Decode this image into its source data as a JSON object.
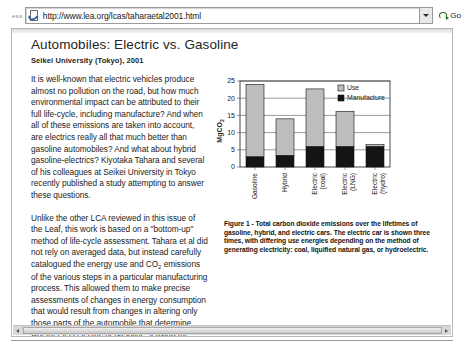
{
  "browser": {
    "addr_prefix": "ess",
    "url": "http://www.lea.org/lcas/taharaetal2001.html",
    "go_label": "Go",
    "ie_icon": "internet-explorer-page-icon",
    "dropdown_icon": "chevron-down-icon",
    "go_icon": "go-arrow-icon"
  },
  "document": {
    "title": "Automobiles: Electric vs. Gasoline",
    "subtitle": "Seikei University (Tokyo), 2001",
    "paragraph1_a": "It is well-known that electric vehicles produce almost no pollution on the road, but how much environmental impact can be attributed to their full life-cycle, including manufacture? And when all of these emissions are taken into account, are electrics really all that much better than gasoline automobiles? And what about hybrid gasoline-electrics? Kiyotaka Tahara and several of his colleagues at Seikei University in Tokyo recently published a study attempting to answer these questions.",
    "paragraph2_a": "Unlike the other LCA reviewed in this issue of the Leaf, this work is based on a \"bottom-up\" method of life-cycle assessment. Tahara et al did not rely on averaged data, but instead carefully catalogued the energy use and CO",
    "paragraph2_sub": "2",
    "paragraph2_b": " emissions of the various steps in a particular manufacturing process. This allowed them to make precise assessments of changes in energy consumption that would result from changes in altering only those parts of the automobile that determine whether it is electric or gasoline, leaving the body, interior, tires etc. unchanged. This ensures a fair comparison between the gasoline, electric and hybrid models.",
    "figure_caption": "Figure 1 - Total carbon dioxide emissions over the lifetimes of gasoline, hybrid, and electric cars. The electric car is shown three times, with differing use energies depending on the method of generating electricity: coal, liquified natural gas, or hydroelectric."
  },
  "chart_data": {
    "type": "bar",
    "stacked": true,
    "title": "",
    "xlabel": "",
    "ylabel": "MgCO2",
    "ylabel_display": "MgCO",
    "ylabel_sub": "2",
    "ylim": [
      0,
      25
    ],
    "yticks": [
      0,
      5,
      10,
      15,
      20,
      25
    ],
    "grid": true,
    "legend_position": "top-right",
    "categories": [
      "Gasoline",
      "Hybrid",
      "Electric (coal)",
      "Electric (LNG)",
      "Electric (hydro)"
    ],
    "category_lines": [
      [
        "Gasoline"
      ],
      [
        "Hybrid"
      ],
      [
        "Electric",
        "(coal)"
      ],
      [
        "Electric",
        "(LNG)"
      ],
      [
        "Electric",
        "(hydro)"
      ]
    ],
    "series": [
      {
        "name": "Manufacture",
        "color": "#141414",
        "values": [
          3.0,
          3.4,
          6.0,
          6.0,
          6.0
        ]
      },
      {
        "name": "Use",
        "color": "#bdbdbd",
        "values": [
          21.0,
          10.6,
          16.7,
          10.2,
          0.5
        ]
      }
    ],
    "totals": [
      24.0,
      14.0,
      22.7,
      16.2,
      6.5
    ],
    "legend": [
      {
        "label": "Use",
        "color": "#bdbdbd"
      },
      {
        "label": "Manufacture",
        "color": "#141414"
      }
    ]
  },
  "scrollbar": {
    "left_arrow_icon": "arrow-left-icon",
    "right_arrow_icon": "arrow-right-icon"
  }
}
